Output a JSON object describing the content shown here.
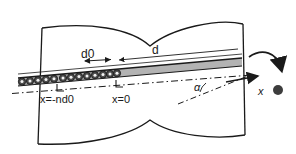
{
  "figure": {
    "kind": "technical-line-diagram",
    "background_color": "#ffffff",
    "ink_color": "#1a1a1a",
    "band_fill_color": "#b3b3b3",
    "bead_fill_color": "#4d4d4d",
    "particle_color": "#3d3d3d"
  },
  "labels": {
    "d0": "d0",
    "d": "d",
    "x_minus_nd0": "x=-nd0",
    "x_zero": "x=0",
    "x_axis": "x",
    "alpha": "α"
  },
  "geometry": {
    "vessel_outline": "M 42,28 L 38,144 L 150,120 L 243,135 L 245,24 L 150,46 Z",
    "top_wall_path": "M 42,28 C 90,22 130,28 150,46 C 172,28 218,18 243,24",
    "bottom_wall_path": "M 38,144 C 86,146 130,136 150,120 C 172,136 216,140 245,135",
    "left_wall": {
      "x1": 42,
      "y1": 28,
      "x2": 38,
      "y2": 144
    },
    "right_wall": {
      "x1": 243,
      "y1": 24,
      "x2": 245,
      "y2": 135
    },
    "band_top_path": "M 18,78 L 242,58",
    "band_bottom_path": "M 18,85 L 242,66",
    "chain_start_x": 18,
    "chain_end_x": 118,
    "centerline_path": "M 14,93 L 250,75",
    "angle_line_path": "M 190,100 L 248,76",
    "x_arrow": {
      "x1": 228,
      "y1": 82,
      "x2": 256,
      "y2": 76
    },
    "rotation_arrow": "M 250,58 C 262,50 276,54 280,70",
    "free_particle": {
      "cx": 278,
      "cy": 89,
      "r": 5
    },
    "dim_d0": {
      "x1": 83,
      "y1": 61,
      "x2": 112,
      "y2": 59
    },
    "dim_d": {
      "x1": 117,
      "y1": 60,
      "x2": 239,
      "y2": 49
    },
    "tick_nd0": {
      "x": 57,
      "y": 86
    },
    "tick_x0": {
      "x": 116,
      "y": 82
    }
  },
  "beads": {
    "count": 13,
    "radius": 3.6,
    "items": [
      {
        "cx": 22,
        "cy": 81.6,
        "filled": true
      },
      {
        "cx": 30,
        "cy": 80.9,
        "filled": true
      },
      {
        "cx": 38,
        "cy": 80.2,
        "filled": true
      },
      {
        "cx": 46,
        "cy": 79.5,
        "filled": true
      },
      {
        "cx": 54,
        "cy": 78.8,
        "filled": true
      },
      {
        "cx": 63,
        "cy": 78.0,
        "filled": true
      },
      {
        "cx": 71,
        "cy": 77.3,
        "filled": true
      },
      {
        "cx": 79,
        "cy": 76.6,
        "filled": true
      },
      {
        "cx": 87,
        "cy": 75.9,
        "filled": true
      },
      {
        "cx": 95,
        "cy": 75.2,
        "filled": true
      },
      {
        "cx": 103,
        "cy": 74.5,
        "filled": true
      },
      {
        "cx": 110,
        "cy": 73.9,
        "filled": true
      },
      {
        "cx": 117,
        "cy": 73.3,
        "filled": true
      }
    ]
  }
}
